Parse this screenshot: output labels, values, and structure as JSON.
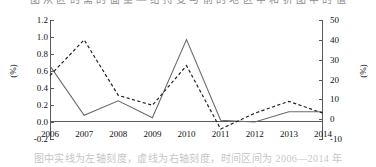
{
  "caption": {
    "top_text": "图 从 区 的 需 的 面 量 — 给 持 变 与 前 的 地 区 中 和 折 图 中 的 值",
    "bottom_text": "图中实线为左轴刻度，虚线为右轴刻度，时间区间为 2006—2014 年"
  },
  "chart_data": {
    "type": "line",
    "title": "",
    "xlabel": "",
    "grid": false,
    "legend_position": "none",
    "x": [
      2006,
      2007,
      2008,
      2009,
      2010,
      2011,
      2012,
      2013,
      2014
    ],
    "categories": [
      "2006",
      "2007",
      "2008",
      "2009",
      "2010",
      "2011",
      "2012",
      "2013",
      "2014"
    ],
    "axes": {
      "left": {
        "label": "(%)",
        "ylim": [
          -0.2,
          1.2
        ],
        "ticks": [
          1.2,
          1.0,
          0.8,
          0.6,
          0.4,
          0.2,
          0.0,
          -0.2
        ],
        "tick_labels": [
          "1.2",
          "1.0",
          "0.8",
          "0.6",
          "0.4",
          "0.2",
          "0.0",
          "-0.2"
        ]
      },
      "right": {
        "label": "(%)",
        "ylim": [
          -10,
          50
        ],
        "ticks": [
          50,
          40,
          30,
          20,
          10,
          0,
          -10
        ],
        "tick_labels": [
          "50",
          "40",
          "30",
          "20",
          "10",
          "0",
          "-10"
        ]
      }
    },
    "series": [
      {
        "name": "left-axis-series",
        "style": "solid",
        "axis": "left",
        "color": "#6b6b6b",
        "values": [
          0.66,
          0.08,
          0.25,
          0.05,
          0.97,
          0.02,
          0.0,
          0.12,
          0.12
        ]
      },
      {
        "name": "right-axis-series",
        "style": "dashed",
        "axis": "right",
        "color": "#222222",
        "values": [
          22,
          40,
          12,
          7,
          27,
          -5,
          3,
          9,
          3
        ]
      }
    ]
  }
}
